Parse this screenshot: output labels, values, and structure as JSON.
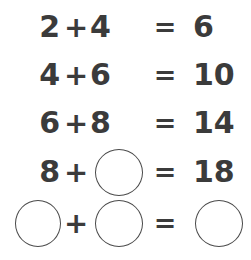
{
  "worksheet": {
    "title": "Addition sequence puzzle",
    "background_color": "#ffffff",
    "text_color": "#3b3b3b",
    "circle_stroke_color": "#4a4a4a",
    "plus_sign": "+",
    "equals_sign": "=",
    "blank_symbol": "circle-blank",
    "rows": [
      {
        "operand_a": "2",
        "operand_a_blank": false,
        "operator": "+",
        "operand_b": "4",
        "operand_b_blank": false,
        "equals": "=",
        "answer": "6",
        "answer_blank": false
      },
      {
        "operand_a": "4",
        "operand_a_blank": false,
        "operator": "+",
        "operand_b": "6",
        "operand_b_blank": false,
        "equals": "=",
        "answer": "10",
        "answer_blank": false
      },
      {
        "operand_a": "6",
        "operand_a_blank": false,
        "operator": "+",
        "operand_b": "8",
        "operand_b_blank": false,
        "equals": "=",
        "answer": "14",
        "answer_blank": false
      },
      {
        "operand_a": "8",
        "operand_a_blank": false,
        "operator": "+",
        "operand_b": "",
        "operand_b_blank": true,
        "equals": "=",
        "answer": "18",
        "answer_blank": false
      },
      {
        "operand_a": "",
        "operand_a_blank": true,
        "operator": "+",
        "operand_b": "",
        "operand_b_blank": true,
        "equals": "=",
        "answer": "",
        "answer_blank": true
      }
    ]
  }
}
